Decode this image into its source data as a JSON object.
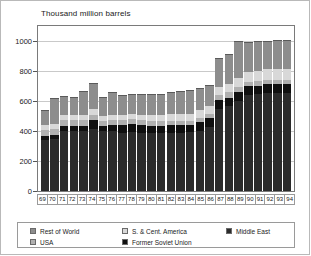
{
  "chart_data": {
    "type": "bar",
    "title": "Thousand million barrels",
    "subtitle": "",
    "xlabel": "",
    "ylabel": "Thousand million barrels",
    "stacked": true,
    "grid": true,
    "legend_position": "bottom",
    "ylim": [
      0,
      1100
    ],
    "yticks": [
      0,
      200,
      400,
      600,
      800,
      1000
    ],
    "ytick_labels": [
      "0",
      "200",
      "400",
      "600",
      "800",
      "1000"
    ],
    "categories": [
      "69",
      "70",
      "71",
      "72",
      "73",
      "74",
      "75",
      "76",
      "77",
      "78",
      "79",
      "80",
      "81",
      "82",
      "83",
      "84",
      "85",
      "86",
      "87",
      "88",
      "89",
      "90",
      "91",
      "92",
      "93",
      "94"
    ],
    "series": [
      {
        "name": "Middle East",
        "color": "#2b2b2b",
        "values": [
          340,
          345,
          400,
          400,
          400,
          415,
          400,
          400,
          390,
          395,
          390,
          385,
          385,
          390,
          390,
          395,
          400,
          425,
          545,
          565,
          600,
          640,
          645,
          655,
          655,
          655
        ]
      },
      {
        "name": "Former Soviet Union",
        "color": "#101010",
        "values": [
          30,
          30,
          35,
          35,
          35,
          60,
          35,
          40,
          50,
          50,
          50,
          50,
          50,
          50,
          50,
          45,
          60,
          60,
          60,
          58,
          58,
          57,
          57,
          57,
          57,
          57
        ]
      },
      {
        "name": "USA",
        "color": "#b0b0b0",
        "values": [
          40,
          40,
          38,
          37,
          36,
          35,
          34,
          33,
          32,
          32,
          31,
          31,
          30,
          30,
          30,
          30,
          30,
          30,
          34,
          34,
          34,
          33,
          32,
          31,
          30,
          30
        ]
      },
      {
        "name": "S. & Cent. America",
        "color": "#d8d8d8",
        "values": [
          30,
          32,
          33,
          33,
          34,
          35,
          34,
          34,
          36,
          36,
          36,
          38,
          40,
          42,
          44,
          46,
          48,
          50,
          55,
          58,
          62,
          65,
          68,
          70,
          72,
          74
        ]
      },
      {
        "name": "Rest of World",
        "color": "#8d8d8d",
        "values": [
          100,
          170,
          125,
          125,
          160,
          175,
          125,
          155,
          130,
          135,
          140,
          140,
          140,
          145,
          155,
          155,
          150,
          140,
          195,
          200,
          245,
          200,
          195,
          185,
          190,
          190
        ]
      }
    ],
    "totals": [
      540,
      617,
      631,
      630,
      665,
      720,
      628,
      662,
      638,
      648,
      647,
      644,
      645,
      657,
      669,
      671,
      688,
      705,
      889,
      915,
      999,
      995,
      997,
      998,
      1004,
      1006
    ],
    "stack_order_bottom_to_top": [
      "Middle East",
      "Former Soviet Union",
      "USA",
      "S. & Cent. America",
      "Rest of World"
    ]
  },
  "legend": {
    "rows": [
      [
        {
          "label": "Rest of World",
          "color": "#8d8d8d"
        },
        {
          "label": "S. & Cent. America",
          "color": "#d8d8d8"
        },
        {
          "label": "Middle East",
          "color": "#2b2b2b"
        }
      ],
      [
        {
          "label": "USA",
          "color": "#b0b0b0"
        },
        {
          "label": "Former Soviet Union",
          "color": "#101010"
        }
      ]
    ]
  }
}
